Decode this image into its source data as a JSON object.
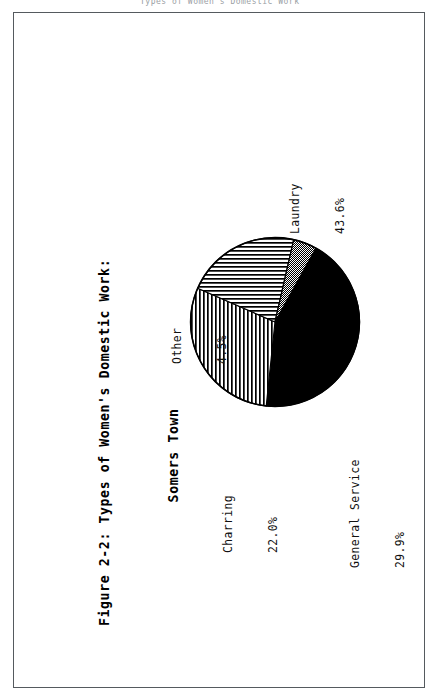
{
  "page": {
    "header_faint_text": "Types of Women's Domestic Work",
    "background_color": "#ffffff",
    "border_color": "#555a5e"
  },
  "figure": {
    "title_line1": "Figure 2-2: Types of Women's Domestic Work:",
    "title_line2": "Somers Town"
  },
  "chart_data": {
    "type": "pie",
    "title": "Figure 2-2: Types of Women's Domestic Work: Somers Town",
    "xlabel": "",
    "ylabel": "",
    "unit": "%",
    "legend_position": "outside-labels",
    "grid": false,
    "categories": [
      "Laundry",
      "General Service",
      "Charring",
      "Other"
    ],
    "values": [
      43.6,
      29.9,
      22.0,
      4.5
    ],
    "value_labels": [
      "43.6%",
      "29.9%",
      "22.0%",
      "4.5%"
    ],
    "fills": [
      "solid-black",
      "vertical-stripes",
      "horizontal-stripes",
      "checker-dots"
    ],
    "start_angle_deg": -61,
    "direction": "clockwise",
    "slices": [
      {
        "name": "Laundry",
        "value": 43.6,
        "value_label": "43.6%",
        "fill": "solid-black"
      },
      {
        "name": "General Service",
        "value": 29.9,
        "value_label": "29.9%",
        "fill": "vertical-stripes"
      },
      {
        "name": "Charring",
        "value": 22.0,
        "value_label": "22.0%",
        "fill": "horizontal-stripes"
      },
      {
        "name": "Other",
        "value": 4.5,
        "value_label": "4.5%",
        "fill": "checker-dots"
      }
    ]
  }
}
